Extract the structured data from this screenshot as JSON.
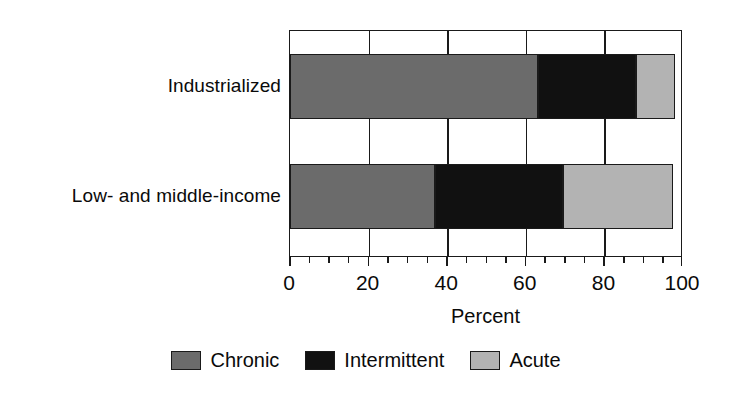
{
  "chart_data": {
    "type": "bar",
    "orientation": "horizontal",
    "stacked": true,
    "title": "",
    "xlabel": "Percent",
    "ylabel": "",
    "xlim": [
      0,
      100
    ],
    "ylim": null,
    "grid": true,
    "legend_position": "bottom",
    "categories": [
      "Industrialized",
      "Low- and middle-income"
    ],
    "series": [
      {
        "name": "Chronic",
        "color": "#6b6b6b",
        "values": [
          63,
          37
        ]
      },
      {
        "name": "Intermittent",
        "color": "#111111",
        "values": [
          25,
          32.5
        ]
      },
      {
        "name": "Acute",
        "color": "#b3b3b3",
        "values": [
          10,
          28
        ]
      }
    ],
    "xticks": [
      0,
      20,
      40,
      60,
      80,
      100
    ],
    "xtick_labels": [
      "0",
      "20",
      "40",
      "60",
      "80",
      "100"
    ],
    "x_minor_tick_interval": 5,
    "gridlines_at": [
      20,
      40,
      60,
      80
    ]
  },
  "axis": {
    "x_title": "Percent",
    "tick_labels": [
      "0",
      "20",
      "40",
      "60",
      "80",
      "100"
    ],
    "category_labels": [
      "Industrialized",
      "Low- and middle-income"
    ]
  },
  "legend": {
    "items": [
      {
        "label": "Chronic",
        "swatch": "legend-swatch-chronic"
      },
      {
        "label": "Intermittent",
        "swatch": "legend-swatch-intermittent"
      },
      {
        "label": "Acute",
        "swatch": "legend-swatch-acute"
      }
    ]
  },
  "colors": {
    "chronic": "#6b6b6b",
    "intermittent": "#111111",
    "acute": "#b3b3b3",
    "axis": "#1a1a1a",
    "background": "#ffffff",
    "text": "#0a0a0a"
  }
}
